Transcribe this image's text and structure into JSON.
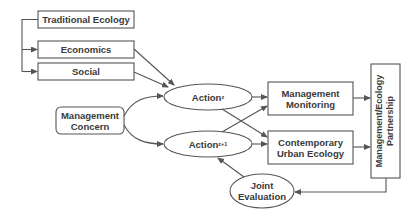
{
  "diagram": {
    "colors": {
      "stroke": "#555555",
      "text": "#3a3a3a",
      "background": "#ffffff"
    },
    "nodes": {
      "traditional_ecology": {
        "label": "Traditional Ecology",
        "shape": "rect"
      },
      "economics": {
        "label": "Economics",
        "shape": "rect"
      },
      "social": {
        "label": "Social",
        "shape": "rect"
      },
      "management_concern": {
        "line1": "Management",
        "line2": "Concern",
        "shape": "rounded-rect"
      },
      "action_z": {
        "label": "Action",
        "subscript": "z",
        "shape": "ellipse"
      },
      "action_z1": {
        "label": "Action",
        "subscript": "z+1",
        "shape": "ellipse"
      },
      "management_monitoring": {
        "line1": "Management",
        "line2": "Monitoring",
        "shape": "rect"
      },
      "contemporary_urban_ecology": {
        "line1": "Contemporary",
        "line2": "Urban Ecology",
        "shape": "rect"
      },
      "partnership": {
        "line1": "Management/Ecology",
        "line2": "Partnership",
        "shape": "rect-vertical"
      },
      "joint_evaluation": {
        "line1": "Joint",
        "line2": "Evaluation",
        "shape": "ellipse"
      }
    },
    "edges": [
      {
        "from": "traditional_ecology",
        "to": "economics"
      },
      {
        "from": "traditional_ecology",
        "to": "social"
      },
      {
        "from": "economics",
        "to": "action_z"
      },
      {
        "from": "social",
        "to": "action_z"
      },
      {
        "from": "management_concern",
        "to": "action_z"
      },
      {
        "from": "management_concern",
        "to": "action_z1"
      },
      {
        "from": "action_z",
        "to": "management_monitoring"
      },
      {
        "from": "action_z",
        "to": "contemporary_urban_ecology"
      },
      {
        "from": "action_z1",
        "to": "management_monitoring"
      },
      {
        "from": "action_z1",
        "to": "contemporary_urban_ecology"
      },
      {
        "from": "management_monitoring",
        "to": "partnership"
      },
      {
        "from": "contemporary_urban_ecology",
        "to": "partnership"
      },
      {
        "from": "partnership",
        "to": "joint_evaluation"
      },
      {
        "from": "joint_evaluation",
        "to": "action_z1"
      }
    ]
  }
}
